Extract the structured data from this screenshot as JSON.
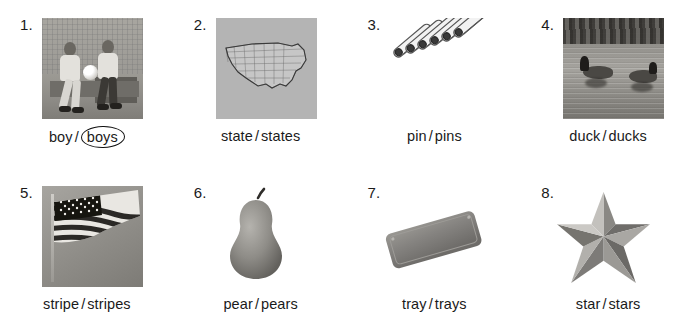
{
  "worksheet": {
    "background_color": "#ffffff",
    "text_color": "#1a1a1a",
    "separator": "/",
    "items": [
      {
        "number": "1.",
        "picture": "photo-two-boys-sitting-on-bench-with-soccer-ball",
        "singular": "boy",
        "plural": "boys",
        "circled": "plural"
      },
      {
        "number": "2.",
        "picture": "map-of-united-states-with-state-borders",
        "singular": "state",
        "plural": "states",
        "circled": "none"
      },
      {
        "number": "3.",
        "picture": "illustration-six-safety-pins",
        "singular": "pin",
        "plural": "pins",
        "circled": "none"
      },
      {
        "number": "4.",
        "picture": "photo-two-ducks-swimming-on-water",
        "singular": "duck",
        "plural": "ducks",
        "circled": "none"
      },
      {
        "number": "5.",
        "picture": "photo-american-flag-on-pole",
        "singular": "stripe",
        "plural": "stripes",
        "circled": "none"
      },
      {
        "number": "6.",
        "picture": "photo-pear-with-stem",
        "singular": "pear",
        "plural": "pears",
        "circled": "none"
      },
      {
        "number": "7.",
        "picture": "photo-rectangular-serving-tray",
        "singular": "tray",
        "plural": "trays",
        "circled": "none"
      },
      {
        "number": "8.",
        "picture": "photo-five-pointed-star",
        "singular": "star",
        "plural": "stars",
        "circled": "none"
      }
    ]
  }
}
